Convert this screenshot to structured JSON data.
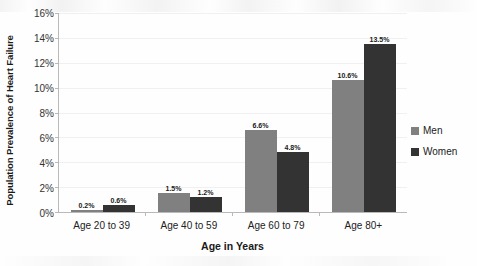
{
  "chart_data": {
    "type": "bar",
    "title": "",
    "xlabel": "Age in Years",
    "ylabel": "Population Prevalence of Heart Failure",
    "categories": [
      "Age 20 to 39",
      "Age 40 to 59",
      "Age 60 to 79",
      "Age 80+"
    ],
    "series": [
      {
        "name": "Men",
        "color": "#808080",
        "values": [
          0.2,
          1.5,
          6.6,
          10.6
        ],
        "labels": [
          "0.2%",
          "1.5%",
          "6.6%",
          "10.6%"
        ]
      },
      {
        "name": "Women",
        "color": "#333333",
        "values": [
          0.6,
          1.2,
          4.8,
          13.5
        ],
        "labels": [
          "0.6%",
          "1.2%",
          "4.8%",
          "13.5%"
        ]
      }
    ],
    "ylim": [
      0,
      16
    ],
    "ytick_values": [
      0,
      2,
      4,
      6,
      8,
      10,
      12,
      14,
      16
    ],
    "ytick_labels": [
      "0%",
      "2%",
      "4%",
      "6%",
      "8%",
      "10%",
      "12%",
      "14%",
      "16%"
    ],
    "grid": true,
    "legend_position": "right",
    "legend_entries": [
      "Men",
      "Women"
    ]
  }
}
